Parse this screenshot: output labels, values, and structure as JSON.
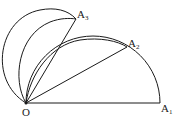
{
  "diagram": {
    "type": "geometry",
    "stroke_color": "#1a1a1a",
    "background": "#ffffff",
    "points": {
      "O": {
        "label": "O",
        "sub": "",
        "x": 26,
        "y": 103
      },
      "A1": {
        "label": "A",
        "sub": "1",
        "x": 160,
        "y": 103
      },
      "A2": {
        "label": "A",
        "sub": "2",
        "x": 127,
        "y": 47
      },
      "A3": {
        "label": "A",
        "sub": "3",
        "x": 76,
        "y": 19
      }
    },
    "segments": [
      [
        "O",
        "A1"
      ],
      [
        "O",
        "A2"
      ],
      [
        "O",
        "A3"
      ]
    ],
    "arcs": [
      {
        "name": "big-semicircle",
        "description": "semicircle on diameter OA1 through A2 and A3"
      },
      {
        "name": "outer-left-arc",
        "description": "arc from O around the left to A3"
      },
      {
        "name": "middle-arc",
        "description": "arc from O to A3"
      },
      {
        "name": "inner-arc",
        "description": "arc from O to A2"
      }
    ]
  }
}
